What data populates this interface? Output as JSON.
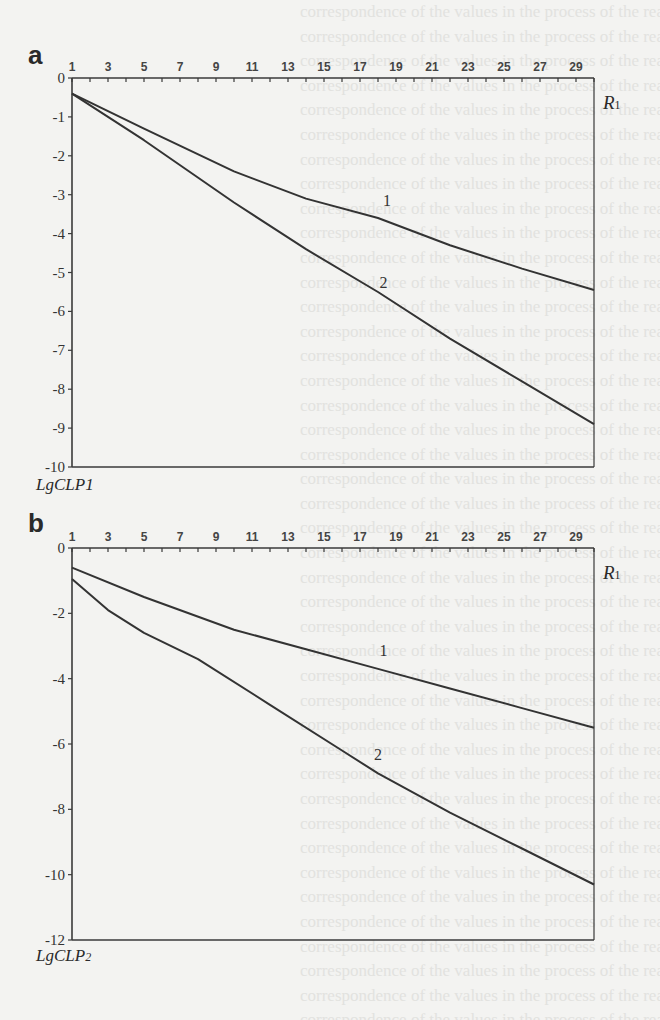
{
  "chart_data": [
    {
      "panel": "a",
      "type": "line",
      "title": "",
      "xlabel": "R1",
      "ylabel": "LgCLP1",
      "x_tick_labels": [
        "1",
        "3",
        "5",
        "7",
        "9",
        "11",
        "13",
        "15",
        "17",
        "19",
        "21",
        "23",
        "25",
        "27",
        "29"
      ],
      "y_tick_labels": [
        "0",
        "-1",
        "-2",
        "-3",
        "-4",
        "-5",
        "-6",
        "-7",
        "-8",
        "-9",
        "-10"
      ],
      "xlim": [
        1,
        30
      ],
      "ylim": [
        -10,
        0
      ],
      "grid": false,
      "x_axis_position": "top",
      "series": [
        {
          "name": "1",
          "x": [
            1,
            5,
            10,
            14,
            18,
            22,
            26,
            30
          ],
          "y": [
            -0.4,
            -1.3,
            -2.4,
            -3.1,
            -3.6,
            -4.3,
            -4.9,
            -5.45
          ]
        },
        {
          "name": "2",
          "x": [
            1,
            5,
            10,
            14,
            18,
            22,
            26,
            30
          ],
          "y": [
            -0.4,
            -1.6,
            -3.2,
            -4.4,
            -5.5,
            -6.7,
            -7.8,
            -8.9
          ]
        }
      ],
      "annotations": [
        {
          "text": "1",
          "x": 18.5,
          "y": -3.3
        },
        {
          "text": "2",
          "x": 18.3,
          "y": -5.4
        }
      ]
    },
    {
      "panel": "b",
      "type": "line",
      "title": "",
      "xlabel": "R1",
      "ylabel": "LgCLP2",
      "x_tick_labels": [
        "1",
        "3",
        "5",
        "7",
        "9",
        "11",
        "13",
        "15",
        "17",
        "19",
        "21",
        "23",
        "25",
        "27",
        "29"
      ],
      "y_tick_labels": [
        "0",
        "-2",
        "-4",
        "-6",
        "-8",
        "-10",
        "-12"
      ],
      "xlim": [
        1,
        30
      ],
      "ylim": [
        -12,
        0
      ],
      "grid": false,
      "x_axis_position": "top",
      "series": [
        {
          "name": "1",
          "x": [
            1,
            5,
            10,
            14,
            18,
            22,
            26,
            30
          ],
          "y": [
            -0.6,
            -1.5,
            -2.5,
            -3.1,
            -3.7,
            -4.3,
            -4.9,
            -5.5
          ]
        },
        {
          "name": "2",
          "x": [
            1,
            3,
            5,
            8,
            12,
            16,
            18,
            22,
            26,
            30
          ],
          "y": [
            -0.95,
            -1.9,
            -2.6,
            -3.4,
            -4.8,
            -6.2,
            -6.9,
            -8.1,
            -9.2,
            -10.3
          ]
        }
      ],
      "annotations": [
        {
          "text": "1",
          "x": 18.3,
          "y": -3.3
        },
        {
          "text": "2",
          "x": 18.0,
          "y": -6.5
        }
      ]
    }
  ],
  "panels": {
    "a": {
      "letter": "a",
      "ylabel": "LgCLP1",
      "xlabel_main": "R",
      "xlabel_sub": "1"
    },
    "b": {
      "letter": "b",
      "ylabel_main": "LgCLP",
      "ylabel_sub": "2",
      "xlabel_main": "R",
      "xlabel_sub": "1"
    }
  }
}
